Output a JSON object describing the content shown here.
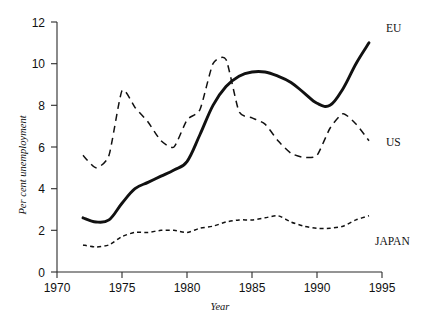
{
  "chart_data": {
    "type": "line",
    "title": "",
    "xlabel": "Year",
    "ylabel": "Per cent unemployment",
    "xlim": [
      1970,
      1995
    ],
    "ylim": [
      0,
      12
    ],
    "xticks": [
      1970,
      1975,
      1980,
      1985,
      1990,
      1995
    ],
    "yticks": [
      0,
      2,
      4,
      6,
      8,
      10,
      12
    ],
    "grid": false,
    "legend_position": "right-inline",
    "x": [
      1972,
      1973,
      1974,
      1975,
      1976,
      1977,
      1978,
      1979,
      1980,
      1981,
      1982,
      1983,
      1984,
      1985,
      1986,
      1987,
      1988,
      1989,
      1990,
      1991,
      1992,
      1993,
      1994
    ],
    "series": [
      {
        "name": "EU",
        "label": "EU",
        "style": "solid-thick",
        "values": [
          2.6,
          2.4,
          2.5,
          3.3,
          4.0,
          4.3,
          4.6,
          4.9,
          5.3,
          6.6,
          8.0,
          8.9,
          9.4,
          9.6,
          9.6,
          9.4,
          9.1,
          8.6,
          8.1,
          8.0,
          8.8,
          10.0,
          11.0
        ]
      },
      {
        "name": "US",
        "label": "US",
        "style": "dashed-long",
        "values": [
          5.6,
          5.0,
          5.6,
          8.7,
          7.9,
          7.2,
          6.3,
          6.0,
          7.3,
          7.8,
          10.0,
          10.2,
          7.7,
          7.4,
          7.1,
          6.3,
          5.7,
          5.5,
          5.6,
          6.9,
          7.6,
          7.1,
          6.3
        ]
      },
      {
        "name": "JAPAN",
        "label": "JAPAN",
        "style": "dashed-short",
        "values": [
          1.3,
          1.2,
          1.3,
          1.7,
          1.9,
          1.9,
          2.0,
          2.0,
          1.9,
          2.1,
          2.2,
          2.4,
          2.5,
          2.5,
          2.6,
          2.7,
          2.4,
          2.2,
          2.1,
          2.1,
          2.2,
          2.5,
          2.7
        ]
      }
    ]
  },
  "axis": {
    "y_title": "Per cent unemployment",
    "x_title": "Year",
    "y_tick_labels": [
      "12",
      "10",
      "8",
      "6",
      "4",
      "2",
      "0"
    ],
    "x_tick_labels": [
      "1970",
      "1975",
      "1980",
      "1985",
      "1990",
      "1995"
    ]
  },
  "legend": {
    "eu": "EU",
    "us": "US",
    "japan": "JAPAN"
  },
  "colors": {
    "line": "#111111",
    "axis": "#2b2b2b",
    "background": "#ffffff"
  }
}
